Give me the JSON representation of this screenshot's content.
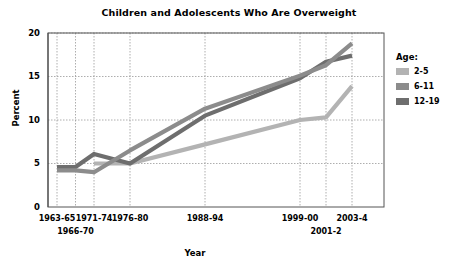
{
  "chart_data": {
    "type": "line",
    "title": "Children and Adolescents Who Are Overweight",
    "xlabel": "Year",
    "ylabel": "Percent",
    "ylim": [
      0,
      20
    ],
    "yticks": [
      0,
      5,
      10,
      15,
      20
    ],
    "grid": true,
    "legend_position": "right",
    "legend_title": "Age:",
    "categories": [
      "1963-65",
      "1966-70",
      "1971-74",
      "1976-80",
      "1988-94",
      "1999-00",
      "2001-2",
      "2003-4"
    ],
    "series": [
      {
        "name": "2-5",
        "color": "#b3b3b3",
        "values": [
          null,
          null,
          5.0,
          5.0,
          7.2,
          10.0,
          10.3,
          13.9
        ]
      },
      {
        "name": "6-11",
        "color": "#8c8c8c",
        "values": [
          4.2,
          4.2,
          4.0,
          6.5,
          11.3,
          15.1,
          16.3,
          18.8
        ]
      },
      {
        "name": "12-19",
        "color": "#6e6e6e",
        "values": [
          4.6,
          4.6,
          6.1,
          5.0,
          10.5,
          14.8,
          16.7,
          17.4
        ]
      }
    ]
  },
  "axis": {
    "y_tick_labels": [
      "20",
      "15",
      "10",
      "5",
      "0"
    ],
    "x_tick_labels": [
      {
        "text": "1963-65",
        "row": 0
      },
      {
        "text": "1966-70",
        "row": 1
      },
      {
        "text": "1971-74",
        "row": 0
      },
      {
        "text": "1976-80",
        "row": 0
      },
      {
        "text": "1988-94",
        "row": 0
      },
      {
        "text": "1999-00",
        "row": 0
      },
      {
        "text": "2001-2",
        "row": 1
      },
      {
        "text": "2003-4",
        "row": 0
      }
    ]
  },
  "legend": {
    "title": "Age:",
    "items": [
      {
        "label": "2-5",
        "color": "#b3b3b3"
      },
      {
        "label": "6-11",
        "color": "#8c8c8c"
      },
      {
        "label": "12-19",
        "color": "#6e6e6e"
      }
    ]
  },
  "style": {
    "plot_border_color": "#555555",
    "grid_color": "#999999",
    "background": "#ffffff"
  }
}
